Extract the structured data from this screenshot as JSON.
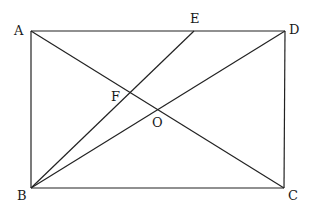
{
  "diagram": {
    "type": "geometry",
    "colors": {
      "line": "#222222",
      "label": "#1a1a1a",
      "background": "#ffffff"
    },
    "points": {
      "A": {
        "label": "A",
        "x": 31,
        "y": 31
      },
      "D": {
        "label": "D",
        "x": 285,
        "y": 31
      },
      "B": {
        "label": "B",
        "x": 31,
        "y": 188
      },
      "C": {
        "label": "C",
        "x": 284,
        "y": 188
      },
      "E": {
        "label": "E",
        "x": 194,
        "y": 31
      },
      "F": {
        "label": "F",
        "x": 131,
        "y": 95
      },
      "O": {
        "label": "O",
        "x": 158,
        "y": 110
      }
    },
    "segments": [
      "AD",
      "DC",
      "CB",
      "BA",
      "AC",
      "BD",
      "BE"
    ]
  }
}
